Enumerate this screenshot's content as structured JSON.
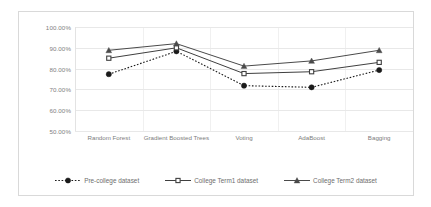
{
  "chart_data": {
    "type": "line",
    "title": "",
    "xlabel": "",
    "ylabel": "",
    "categories": [
      "Random Forest",
      "Gradient Boosted Trees",
      "Voting",
      "AdaBoost",
      "Bagging"
    ],
    "ylim": [
      50,
      100
    ],
    "ytick_labels": [
      "100.00%",
      "90.00%",
      "80.00%",
      "70.00%",
      "60.00%",
      "50.00%"
    ],
    "ytick_values": [
      100,
      90,
      80,
      70,
      60,
      50
    ],
    "grid": true,
    "legend_position": "bottom",
    "series": [
      {
        "name": "Pre-college dataset",
        "values": [
          77.3,
          88.3,
          71.8,
          71.0,
          79.3
        ],
        "marker": "circle-filled",
        "line_style": "dotted",
        "color": "#1a1a1a"
      },
      {
        "name": "College Term1 dataset",
        "values": [
          85.0,
          90.0,
          77.6,
          78.5,
          83.0
        ],
        "marker": "square-open",
        "line_style": "solid",
        "color": "#3f3f3f"
      },
      {
        "name": "College Term2 dataset",
        "values": [
          88.8,
          92.0,
          81.2,
          83.7,
          88.8
        ],
        "marker": "triangle-filled",
        "line_style": "solid",
        "color": "#4a4a4a"
      }
    ]
  },
  "legend": {
    "items": [
      {
        "label": "Pre-college dataset"
      },
      {
        "label": "College Term1 dataset"
      },
      {
        "label": "College Term2 dataset"
      }
    ]
  }
}
